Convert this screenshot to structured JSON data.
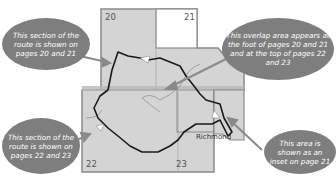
{
  "diagram": {
    "pages": [
      {
        "number": "20",
        "label": "20"
      },
      {
        "number": "21",
        "label": "21"
      },
      {
        "number": "22",
        "label": "22"
      },
      {
        "number": "23",
        "label": "23"
      }
    ],
    "place_labels": {
      "richmond": "Richmond"
    },
    "callouts": [
      {
        "id": "pages-20-21",
        "text": "This section of the route is shown on pages 20 and 21"
      },
      {
        "id": "overlap",
        "text": "This overlap area appears at the foot of pages 20 and 21 and at the top of pages 22 and 23"
      },
      {
        "id": "pages-22-23",
        "text": "This section of the route is shown on pages 22 and 23"
      },
      {
        "id": "inset",
        "text": "This area is shown as an inset on page 21"
      }
    ],
    "colors": {
      "map_fill": "#d4d4d4",
      "page_border": "#8a8a8a",
      "route": "#1a1a1a",
      "river": "#9a9a9a",
      "callout_fill": "#7e7e7e",
      "callout_text": "#ffffff",
      "arrow": "#8a8a8a"
    }
  }
}
